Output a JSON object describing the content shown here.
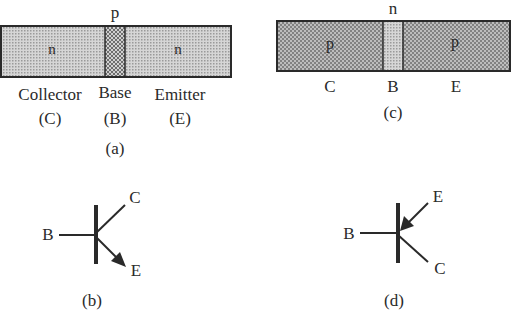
{
  "figure": {
    "panel_a": {
      "caption": "(a)",
      "type": "npn-structure",
      "top_label": "p",
      "regions": [
        {
          "doping": "n",
          "name": "Collector",
          "abbr": "(C)"
        },
        {
          "doping": "p",
          "name": "Base",
          "abbr": "(B)"
        },
        {
          "doping": "n",
          "name": "Emitter",
          "abbr": "(E)"
        }
      ]
    },
    "panel_b": {
      "caption": "(b)",
      "type": "npn-symbol",
      "terminals": {
        "base": "B",
        "collector": "C",
        "emitter": "E"
      }
    },
    "panel_c": {
      "caption": "(c)",
      "type": "pnp-structure",
      "top_label": "n",
      "regions": [
        {
          "doping": "p",
          "abbr": "C"
        },
        {
          "doping": "n",
          "abbr": "B"
        },
        {
          "doping": "p",
          "abbr": "E"
        }
      ]
    },
    "panel_d": {
      "caption": "(d)",
      "type": "pnp-symbol",
      "terminals": {
        "base": "B",
        "collector": "C",
        "emitter": "E"
      }
    }
  },
  "colors": {
    "stroke": "#2a2a2a",
    "n_fill": "#c9c9c9",
    "p_fill": "#a9a9a9"
  }
}
